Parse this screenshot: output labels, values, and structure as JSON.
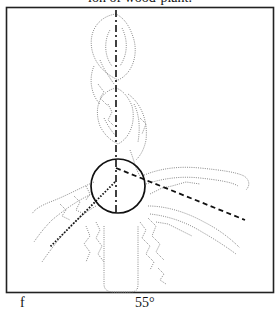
{
  "figure": {
    "caption_top_partial": "ion of wood-plant.",
    "caption_bottom_partial_left": "f",
    "caption_bottom_partial_mid": "55°",
    "frame": {
      "x": 6,
      "y": 7,
      "width": 267,
      "height": 285,
      "stroke": "#222222"
    },
    "plant_color": "#8a8a8a",
    "annotation_color": "#111111",
    "circle": {
      "cx": 118,
      "cy": 186,
      "r": 27
    },
    "axis_line": {
      "x1": 116,
      "y1": 10,
      "x2": 116,
      "y2": 212,
      "style": "dash-dot"
    },
    "branch_line_right": {
      "x1": 116,
      "y1": 168,
      "x2": 245,
      "y2": 220,
      "style": "dashed"
    },
    "branch_line_left": {
      "x1": 115,
      "y1": 182,
      "x2": 50,
      "y2": 247,
      "style": "dotted"
    }
  }
}
